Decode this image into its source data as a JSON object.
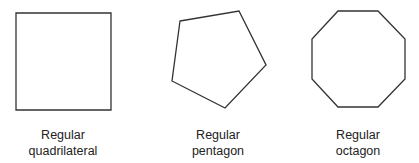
{
  "shapes": [
    {
      "name": "square",
      "label_line1": "Regular",
      "label_line2": "quadrilateral",
      "points": "16,13 111,13 111,110 16,110"
    },
    {
      "name": "pentagon",
      "label_line1": "Regular",
      "label_line2": "pentagon",
      "points": "180,21 239,11 266,65 225,108 172,81"
    },
    {
      "name": "octagon",
      "label_line1": "Regular",
      "label_line2": "octagon",
      "points": "338,11 378,11 405,39 405,79 378,107 338,107 312,79 312,39"
    }
  ],
  "stroke_color": "#333333"
}
